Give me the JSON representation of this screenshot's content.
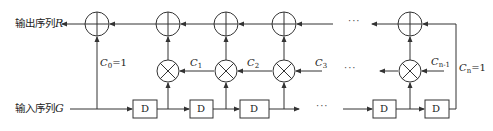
{
  "labels": {
    "output": "输出序列",
    "output_var": "R",
    "input": "输入序列",
    "input_var": "G",
    "delay": "D",
    "ellipsis": "···"
  },
  "coefficients": [
    {
      "sym": "C",
      "sub": "0",
      "suffix": "=1"
    },
    {
      "sym": "C",
      "sub": "1",
      "suffix": ""
    },
    {
      "sym": "C",
      "sub": "2",
      "suffix": ""
    },
    {
      "sym": "C",
      "sub": "3",
      "suffix": ""
    },
    {
      "sym": "C",
      "sub": "n-1",
      "suffix": ""
    },
    {
      "sym": "C",
      "sub": "n",
      "suffix": "=1"
    }
  ],
  "colors": {
    "line": "#333333",
    "text": "#222222",
    "background": "#ffffff"
  }
}
